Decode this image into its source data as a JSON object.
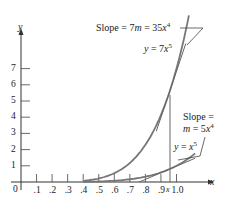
{
  "chart_data": {
    "type": "line",
    "title": "",
    "xlabel": "x",
    "ylabel": "y",
    "xlim": [
      0,
      1.15
    ],
    "ylim": [
      0,
      8.5
    ],
    "grid": false,
    "x_ticks": [
      ".1",
      ".2",
      ".3",
      ".4",
      ".5",
      ".6",
      ".7",
      ".8",
      ".9",
      "1.0"
    ],
    "y_ticks": [
      "1",
      "2",
      "3",
      "4",
      "5",
      "6",
      "7"
    ],
    "origin_label": "0",
    "marked_point": {
      "label": "x",
      "x": 0.95
    },
    "series": [
      {
        "name": "y = 7x^5",
        "function": "7*x^5",
        "x_range": [
          0.4,
          1.08
        ],
        "x": [
          0.4,
          0.5,
          0.6,
          0.7,
          0.8,
          0.9,
          0.95,
          1.0,
          1.05
        ],
        "values": [
          0.07,
          0.22,
          0.54,
          1.18,
          2.29,
          4.13,
          5.42,
          7.0,
          8.93
        ]
      },
      {
        "name": "y = x^5",
        "function": "x^5",
        "x_range": [
          0.4,
          1.12
        ],
        "x": [
          0.4,
          0.5,
          0.6,
          0.7,
          0.8,
          0.9,
          0.95,
          1.0,
          1.1
        ],
        "values": [
          0.01,
          0.03,
          0.08,
          0.17,
          0.33,
          0.59,
          0.77,
          1.0,
          1.61
        ]
      },
      {
        "name": "Tangent to y = 7x^5 at x",
        "type": "tangent",
        "slope_label": "Slope = 7m = 35x^4",
        "x_range": [
          0.87,
          1.06
        ]
      },
      {
        "name": "Tangent to y = x^5 at x",
        "type": "tangent",
        "slope_label": "Slope = m = 5x^4",
        "x_range": [
          0.76,
          1.12
        ]
      }
    ],
    "annotations": [
      {
        "text": "Slope = 7m = 35x⁴",
        "target": "tangent of 7x^5"
      },
      {
        "text": "y = 7x⁵",
        "target": "curve 7x^5"
      },
      {
        "text": "Slope =",
        "target": "tangent of x^5"
      },
      {
        "text": "m = 5x⁴",
        "target": "tangent of x^5"
      },
      {
        "text": "y = x⁵",
        "target": "curve x^5"
      }
    ]
  },
  "labels": {
    "y_axis": "y",
    "x_axis": "x",
    "origin": "0",
    "marked_x": "x",
    "slope_big_prefix": "Slope = 7",
    "slope_big_m": "m",
    "slope_big_mid": " = 35",
    "slope_big_x": "x",
    "slope_big_exp": "4",
    "curve_big_y": "y",
    "curve_big_eq": " = 7",
    "curve_big_x": "x",
    "curve_big_exp": "5",
    "slope_small_line1": "Slope =",
    "slope_small_m": "m",
    "slope_small_mid": " = 5",
    "slope_small_x": "x",
    "slope_small_exp": "4",
    "curve_small_y": "y",
    "curve_small_eq": " = ",
    "curve_small_x": "x",
    "curve_small_exp": "5"
  }
}
